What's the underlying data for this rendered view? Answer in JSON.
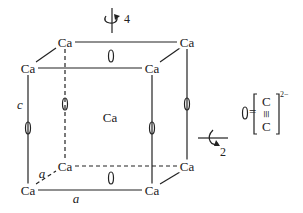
{
  "diagram": {
    "atom_label": "Ca",
    "atoms": {
      "back_top_left": "Ca",
      "back_top_right": "Ca",
      "front_top_left": "Ca",
      "front_top_right": "Ca",
      "center": "Ca",
      "back_bottom_left": "Ca",
      "back_bottom_right": "Ca",
      "front_bottom_left": "Ca",
      "front_bottom_right": "Ca"
    },
    "axes": {
      "c": "c",
      "a1": "a",
      "a2": "a"
    },
    "symmetry": {
      "fourfold": "4",
      "twofold": "2"
    },
    "legend": {
      "equals": "=",
      "top_atom": "C",
      "bond": "≡",
      "bottom_atom": "C",
      "charge": "2−"
    }
  }
}
